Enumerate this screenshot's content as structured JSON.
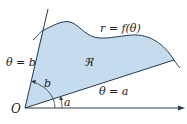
{
  "diagram": {
    "labels": {
      "curve": "r = f(θ)",
      "region": "ℜ",
      "ray_b": "θ = b",
      "ray_a": "θ = a",
      "angle_b": "b",
      "angle_a": "a",
      "origin": "O"
    },
    "colors": {
      "region_fill": "#c5dcef",
      "stroke": "#2a3a4a",
      "text": "#222222"
    }
  }
}
